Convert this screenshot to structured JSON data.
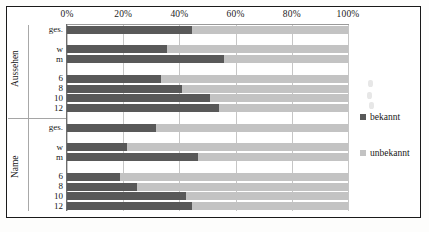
{
  "chart_data": {
    "type": "bar",
    "orientation": "horizontal",
    "stacked": true,
    "normalized_percent": true,
    "title": "",
    "subtitle": "",
    "xlabel": "",
    "ylabel": "",
    "xlim": [
      0,
      100
    ],
    "xtick_labels": [
      "0%",
      "20%",
      "40%",
      "60%",
      "80%",
      "100%"
    ],
    "xtick_values": [
      0,
      20,
      40,
      60,
      80,
      100
    ],
    "grid": true,
    "legend_position": "right",
    "legend": [
      {
        "label": "bekannt",
        "color": "#595959"
      },
      {
        "label": "unbekannt",
        "color": "#c3c3c3"
      }
    ],
    "series": [
      {
        "name": "bekannt",
        "color": "#595959",
        "values": [
          44.5,
          null,
          35.5,
          56.0,
          null,
          33.5,
          41.0,
          51.0,
          54.0,
          null,
          31.5,
          null,
          21.5,
          46.5,
          null,
          19.0,
          25.0,
          42.5,
          44.5
        ]
      },
      {
        "name": "unbekannt",
        "color": "#c3c3c3",
        "values": [
          55.5,
          null,
          64.5,
          44.0,
          null,
          66.5,
          59.0,
          49.0,
          46.0,
          null,
          68.5,
          null,
          78.5,
          53.5,
          null,
          81.0,
          75.0,
          57.5,
          55.5
        ]
      }
    ],
    "groups": [
      {
        "name": "Aussehen",
        "rows": [
          {
            "label": "ges.",
            "bekannt": 44.5,
            "unbekannt": 55.5
          },
          {
            "label": "",
            "bekannt": null,
            "unbekannt": null
          },
          {
            "label": "w",
            "bekannt": 35.5,
            "unbekannt": 64.5
          },
          {
            "label": "m",
            "bekannt": 56.0,
            "unbekannt": 44.0
          },
          {
            "label": "",
            "bekannt": null,
            "unbekannt": null
          },
          {
            "label": "6",
            "bekannt": 33.5,
            "unbekannt": 66.5
          },
          {
            "label": "8",
            "bekannt": 41.0,
            "unbekannt": 59.0
          },
          {
            "label": "10",
            "bekannt": 51.0,
            "unbekannt": 49.0
          },
          {
            "label": "12",
            "bekannt": 54.0,
            "unbekannt": 46.0
          }
        ]
      },
      {
        "name": "Name",
        "rows": [
          {
            "label": "ges.",
            "bekannt": 31.5,
            "unbekannt": 68.5
          },
          {
            "label": "",
            "bekannt": null,
            "unbekannt": null
          },
          {
            "label": "w",
            "bekannt": 21.5,
            "unbekannt": 78.5
          },
          {
            "label": "m",
            "bekannt": 46.5,
            "unbekannt": 53.5
          },
          {
            "label": "",
            "bekannt": null,
            "unbekannt": null
          },
          {
            "label": "6",
            "bekannt": 19.0,
            "unbekannt": 81.0
          },
          {
            "label": "8",
            "bekannt": 25.0,
            "unbekannt": 75.0
          },
          {
            "label": "10",
            "bekannt": 42.5,
            "unbekannt": 57.5
          },
          {
            "label": "12",
            "bekannt": 44.5,
            "unbekannt": 55.5
          }
        ]
      }
    ]
  },
  "colors": {
    "bekannt": "#595959",
    "unbekannt": "#c3c3c3",
    "gridline": "#c6c6c6",
    "axis": "#6d6d6d",
    "border": "#1a1a1a",
    "background": "#ffffff"
  }
}
